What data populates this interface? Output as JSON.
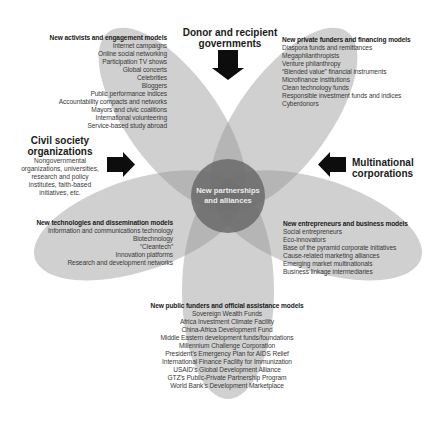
{
  "center": {
    "label_line1": "New partnerships",
    "label_line2": "and alliances"
  },
  "actors": {
    "governments": {
      "line1": "Donor and recipient",
      "line2": "governments"
    },
    "civil_society": {
      "line1": "Civil society",
      "line2": "organizations",
      "sub": [
        "Nongovernmental",
        "organizations, universities,",
        "research and policy",
        "institutes, faith-based",
        "initiatives, etc."
      ]
    },
    "multinationals": {
      "line1": "Multinational",
      "line2": "corporations"
    }
  },
  "petals": {
    "activists": {
      "heading": "New activists and engagement models",
      "items": [
        "Internet campaigns",
        "Online social networking",
        "Participation TV shows",
        "Global concerts",
        "Celebrities",
        "Bloggers",
        "Public performance indices",
        "Accountability compacts and networks",
        "Mayors and civic coalitions",
        "International volunteering",
        "Service-based study abroad"
      ]
    },
    "private_funders": {
      "heading": "New private funders and financing models",
      "items": [
        "Diaspora funds and remittances",
        "Megaphilanthropists",
        "Venture philanthropy",
        "“Blended value” financial instruments",
        "Microfinance institutions",
        "Clean technology funds",
        "Responsible investment funds and indices",
        "Cyberdonors"
      ]
    },
    "technologies": {
      "heading": "New technologies and dissemination models",
      "items": [
        "Information and communications technology",
        "Biotechnology",
        "“Cleantech”",
        "Innovation platforms",
        "Research and development networks"
      ]
    },
    "entrepreneurs": {
      "heading": "New entrepreneurs and business models",
      "items": [
        "Social entrepreneurs",
        "Eco-innovators",
        "Base of the pyramid corporate initiatives",
        "Cause-related marketing alliances",
        "Emerging market multinationals",
        "Business linkage intermediaries"
      ]
    },
    "public_funders": {
      "heading": "New public funders and official assistance models",
      "items": [
        "Sovereign Wealth Funds",
        "Africa Investment Climate Facility",
        "China-Africa Development Fund",
        "Middle Eastern development funds/foundations",
        "Millennium Challenge Corporation",
        "President’s Emergency Plan for AIDS Relief",
        "International Finance Facility for Immunization",
        "USAID’s Global Development Alliance",
        "GTZ’s Public-Private Partnership Program",
        "World Bank’s Development Marketplace"
      ]
    }
  },
  "colors": {
    "petal": "#8f8f8f",
    "petal_opacity": 0.42,
    "center_circle": "#6a6a6a",
    "arrow": "#0d0d0d",
    "background": "#ffffff"
  }
}
